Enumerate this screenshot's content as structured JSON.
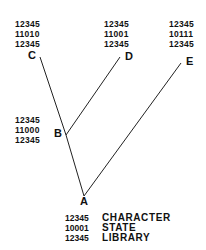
{
  "nodes": {
    "C": {
      "label": "C",
      "character": "12345",
      "state": "11010",
      "library": "12345"
    },
    "D": {
      "label": "D",
      "character": "12345",
      "state": "11001",
      "library": "12345"
    },
    "E": {
      "label": "E",
      "character": "12345",
      "state": "10111",
      "library": "12345"
    },
    "B": {
      "label": "B",
      "character": "12345",
      "state": "11000",
      "library": "12345"
    },
    "A": {
      "label": "A",
      "character": "12345",
      "state": "10001",
      "library": "12345"
    }
  },
  "legend": {
    "character": "CHARACTER",
    "state": "STATE",
    "library": "LIBRARY"
  },
  "edges": [
    {
      "from": "A",
      "to": "B"
    },
    {
      "from": "B",
      "to": "C"
    },
    {
      "from": "B",
      "to": "D"
    },
    {
      "from": "A",
      "to": "E"
    }
  ]
}
